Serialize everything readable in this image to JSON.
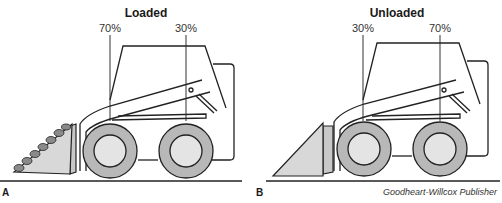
{
  "figure": {
    "panels": [
      {
        "id": "A",
        "title": "Loaded",
        "front_axle_weight": "70%",
        "rear_axle_weight": "30%",
        "bucket_state": "loaded"
      },
      {
        "id": "B",
        "title": "Unloaded",
        "front_axle_weight": "30%",
        "rear_axle_weight": "70%",
        "bucket_state": "empty"
      }
    ],
    "credit": "Goodheart-Willcox Publisher"
  },
  "colors": {
    "line": "#222222",
    "tire": "#b8b8b8",
    "hub": "#e4e4e4",
    "bucket": "#d8d8d8",
    "load": "#8a8a8a",
    "background": "#ffffff"
  }
}
